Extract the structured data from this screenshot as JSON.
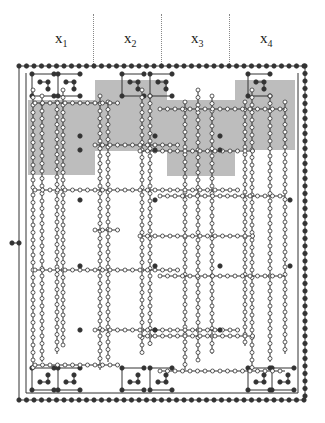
{
  "diagram": {
    "columns": [
      {
        "var": "x",
        "sub": "1"
      },
      {
        "var": "x",
        "sub": "2"
      },
      {
        "var": "x",
        "sub": "3"
      },
      {
        "var": "x",
        "sub": "4"
      }
    ],
    "colors": {
      "line": "#333333",
      "shade": "#bdbdbd",
      "filled_node": "#333333",
      "open_node": "#ffffff"
    }
  }
}
